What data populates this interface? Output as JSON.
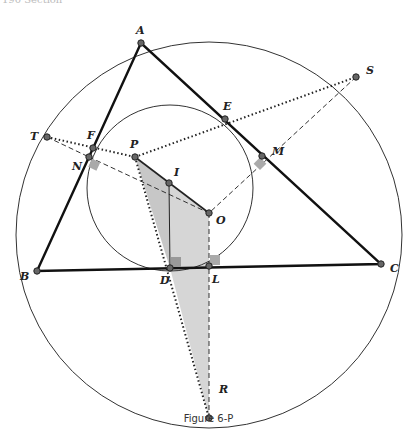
{
  "header": {
    "fragment": "190  Section"
  },
  "figure": {
    "caption": "Figure 6-P",
    "circumcircle": {
      "cx": 209,
      "cy": 235,
      "r": 193
    },
    "incircle": {
      "cx": 170,
      "cy": 188,
      "r": 83
    },
    "points": {
      "A": [
        141,
        43
      ],
      "B": [
        37,
        271
      ],
      "C": [
        381,
        264
      ],
      "S": [
        356,
        77
      ],
      "E": [
        225,
        119
      ],
      "M": [
        262,
        156
      ],
      "T": [
        47,
        137
      ],
      "F": [
        93,
        148
      ],
      "N": [
        89,
        157
      ],
      "P": [
        135,
        157
      ],
      "I": [
        169,
        183
      ],
      "O": [
        209,
        213
      ],
      "D": [
        170,
        268
      ],
      "L": [
        209,
        266
      ],
      "R": [
        209,
        418
      ]
    },
    "labels": [
      "A",
      "B",
      "C",
      "D",
      "E",
      "F",
      "I",
      "L",
      "M",
      "N",
      "O",
      "P",
      "R",
      "S",
      "T"
    ]
  }
}
